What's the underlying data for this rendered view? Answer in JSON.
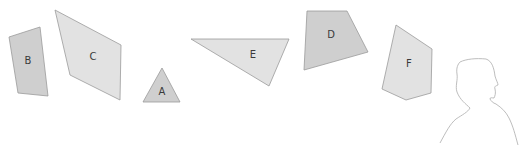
{
  "colors": {
    "light_fill": "#e2e2e2",
    "mid_fill": "#cfcfcf",
    "stroke": "#9a9a9a",
    "silhouette_stroke": "#b5b5b5",
    "label": "#3a3a3a",
    "background": "#ffffff"
  },
  "shapes": [
    {
      "id": "A",
      "label": "A",
      "type": "triangle",
      "fill": "mid",
      "points": "162,68 180,102 143,102",
      "label_pos": [
        162,
        92
      ]
    },
    {
      "id": "B",
      "label": "B",
      "type": "quadrilateral",
      "fill": "mid",
      "points": "9,37 40,27 48,96 18,93",
      "label_pos": [
        28,
        61
      ]
    },
    {
      "id": "C",
      "label": "C",
      "type": "quadrilateral",
      "fill": "light",
      "points": "55,10 121,45 120,100 70,75",
      "label_pos": [
        93,
        57
      ]
    },
    {
      "id": "D",
      "label": "D",
      "type": "quadrilateral",
      "fill": "mid",
      "points": "307,11 347,11 368,52 304,70",
      "label_pos": [
        331,
        35
      ]
    },
    {
      "id": "E",
      "label": "E",
      "type": "triangle",
      "fill": "light",
      "points": "191,39 289,39 269,86",
      "label_pos": [
        253,
        55
      ]
    },
    {
      "id": "F",
      "label": "F",
      "type": "pentagon",
      "fill": "light",
      "points": "396,25 432,49 431,93 406,100 382,89",
      "label_pos": [
        409,
        64
      ]
    }
  ],
  "figure": {
    "type": "person-silhouette-outline",
    "facing": "right"
  }
}
